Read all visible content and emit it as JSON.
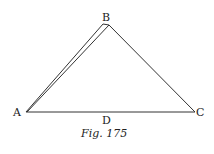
{
  "figure": {
    "caption": "Fig. 175",
    "points": {
      "A": {
        "label": "A",
        "x": 26,
        "y": 112
      },
      "B": {
        "label": "B",
        "x": 109,
        "y": 24
      },
      "C": {
        "label": "C",
        "x": 195,
        "y": 112
      },
      "D": {
        "label": "D",
        "x": 106,
        "y": 112
      }
    },
    "line_color": "#333333",
    "background": "#ffffff"
  }
}
